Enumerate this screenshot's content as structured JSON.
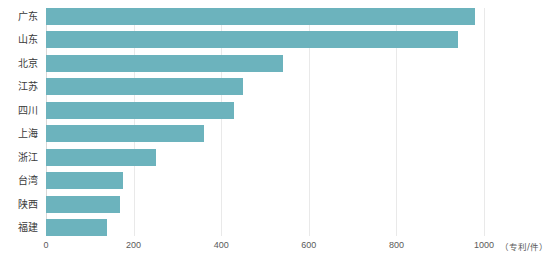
{
  "chart_data": {
    "type": "bar",
    "orientation": "horizontal",
    "title": "",
    "subtitle": "",
    "xlabel": "",
    "ylabel": "",
    "unit_label": "（专利/件）",
    "categories": [
      "广东",
      "山东",
      "北京",
      "江苏",
      "四川",
      "上海",
      "浙江",
      "台湾",
      "陕西",
      "福建"
    ],
    "values": [
      980,
      940,
      540,
      450,
      430,
      360,
      250,
      175,
      170,
      140
    ],
    "xlim": [
      0,
      1000
    ],
    "xticks": [
      0,
      200,
      400,
      600,
      800,
      1000
    ],
    "xtick_labels": [
      "0",
      "200",
      "400",
      "600",
      "800",
      "1000"
    ],
    "grid": true,
    "grid_axis": "x",
    "legend": false,
    "legend_position": "none",
    "bar_color": "#6cb3bd",
    "grid_color": "#e9e9e9",
    "background": "#ffffff",
    "text_color": "#3a3a3a"
  }
}
